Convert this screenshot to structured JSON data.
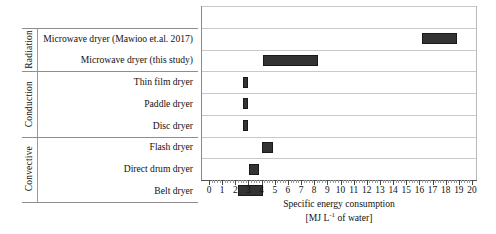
{
  "chart_data": {
    "type": "bar",
    "orientation": "horizontal",
    "title": "",
    "xlabel_line1": "Specific energy consumption",
    "xlabel_line2_pre": "[MJ L",
    "xlabel_line2_sup": "-1",
    "xlabel_line2_post": " of water]",
    "ylabel": "",
    "xlim": [
      0,
      20
    ],
    "xticks": [
      0,
      1,
      2,
      3,
      4,
      5,
      6,
      7,
      8,
      9,
      10,
      11,
      12,
      13,
      14,
      15,
      16,
      17,
      18,
      19,
      20
    ],
    "xticklabels": [
      "0",
      "1",
      "2",
      "3",
      "4",
      "5",
      "6",
      "7",
      "8",
      "9",
      "10",
      "11",
      "12",
      "13",
      "14",
      "15",
      "16",
      "17",
      "18",
      "19",
      "20"
    ],
    "minor_tick_interval": 0.2,
    "grid": false,
    "bar_color": "#333333",
    "bar_edge_color": "#1a1a1a",
    "groups": [
      {
        "name": "Radiation",
        "rows": [
          {
            "label": "Microwave dryer (Mawioo et.al. 2017)",
            "low": 16.1,
            "high": 18.8
          },
          {
            "label": "Microwave dryer (this study)",
            "low": 4.0,
            "high": 8.2
          }
        ]
      },
      {
        "name": "Conduction",
        "rows": [
          {
            "label": "Thin film dryer",
            "low": 2.5,
            "high": 2.9
          },
          {
            "label": "Paddle dryer",
            "low": 2.5,
            "high": 2.9
          },
          {
            "label": "Disc dryer",
            "low": 2.5,
            "high": 2.9
          }
        ]
      },
      {
        "name": "Convective",
        "rows": [
          {
            "label": "Flash dryer",
            "low": 3.95,
            "high": 4.8
          },
          {
            "label": "Direct drum dryer",
            "low": 2.95,
            "high": 3.75
          },
          {
            "label": "Belt dryer",
            "low": 2.1,
            "high": 4.0
          }
        ]
      }
    ]
  }
}
